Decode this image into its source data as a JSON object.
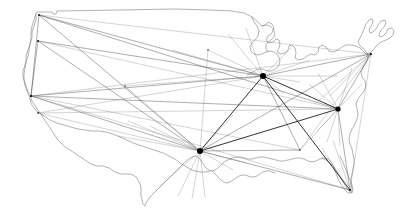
{
  "figure": {
    "type": "network-map",
    "region": "Continental United States",
    "background_color": "#ffffff",
    "outline_color": "#808080",
    "route_color": "#2b2b2b",
    "node_color": "#000000",
    "width": 409,
    "height": 212
  },
  "nodes": [
    {
      "id": "sea",
      "label": "Seattle",
      "x": 39,
      "y": 15,
      "kind": "minor",
      "radius": 0.9
    },
    {
      "id": "pdx",
      "label": "Portland",
      "x": 38,
      "y": 41,
      "kind": "minor",
      "radius": 0.9
    },
    {
      "id": "sfo",
      "label": "San Francisco",
      "x": 31,
      "y": 96,
      "kind": "minor",
      "radius": 1.1
    },
    {
      "id": "lax",
      "label": "Los Angeles",
      "x": 38,
      "y": 113,
      "kind": "minor",
      "radius": 0.8
    },
    {
      "id": "den",
      "label": "Denver",
      "x": 125,
      "y": 86,
      "kind": "minor",
      "radius": 0.7
    },
    {
      "id": "dfw",
      "label": "Dallas Fort Worth",
      "x": 200,
      "y": 151,
      "kind": "hub",
      "radius": 3.0
    },
    {
      "id": "ord",
      "label": "Chicago OHare",
      "x": 263,
      "y": 76,
      "kind": "hub",
      "radius": 3.0
    },
    {
      "id": "iad",
      "label": "Washington Dulles",
      "x": 338,
      "y": 109,
      "kind": "hub",
      "radius": 2.6
    },
    {
      "id": "bos",
      "label": "Boston",
      "x": 371,
      "y": 54,
      "kind": "minor",
      "radius": 1.0
    },
    {
      "id": "mia",
      "label": "Miami",
      "x": 350,
      "y": 190,
      "kind": "minor",
      "radius": 1.0
    },
    {
      "id": "atl",
      "label": "Atlanta",
      "x": 300,
      "y": 150,
      "kind": "minor",
      "radius": 0.7
    },
    {
      "id": "msp",
      "label": "Minneapolis",
      "x": 208,
      "y": 50,
      "kind": "minor",
      "radius": 0.7
    }
  ],
  "routes": [
    {
      "from": "sea",
      "to": "ord",
      "weight": "normal"
    },
    {
      "from": "sea",
      "to": "dfw",
      "weight": "normal"
    },
    {
      "from": "sea",
      "to": "iad",
      "weight": "normal"
    },
    {
      "from": "sea",
      "to": "sfo",
      "weight": "normal"
    },
    {
      "from": "sea",
      "to": "bos",
      "weight": "faint"
    },
    {
      "from": "pdx",
      "to": "ord",
      "weight": "normal"
    },
    {
      "from": "pdx",
      "to": "dfw",
      "weight": "normal"
    },
    {
      "from": "pdx",
      "to": "iad",
      "weight": "faint"
    },
    {
      "from": "pdx",
      "to": "sfo",
      "weight": "normal"
    },
    {
      "from": "sfo",
      "to": "ord",
      "weight": "normal"
    },
    {
      "from": "sfo",
      "to": "dfw",
      "weight": "normal"
    },
    {
      "from": "sfo",
      "to": "iad",
      "weight": "normal"
    },
    {
      "from": "sfo",
      "to": "bos",
      "weight": "faint"
    },
    {
      "from": "sfo",
      "to": "mia",
      "weight": "faint"
    },
    {
      "from": "sfo",
      "to": "atl",
      "weight": "faint"
    },
    {
      "from": "lax",
      "to": "ord",
      "weight": "faint"
    },
    {
      "from": "lax",
      "to": "dfw",
      "weight": "faint"
    },
    {
      "from": "lax",
      "to": "iad",
      "weight": "faint"
    },
    {
      "from": "den",
      "to": "ord",
      "weight": "faint"
    },
    {
      "from": "den",
      "to": "dfw",
      "weight": "faint"
    },
    {
      "from": "dfw",
      "to": "ord",
      "weight": "heavy"
    },
    {
      "from": "dfw",
      "to": "iad",
      "weight": "heavy"
    },
    {
      "from": "dfw",
      "to": "bos",
      "weight": "normal"
    },
    {
      "from": "dfw",
      "to": "mia",
      "weight": "normal"
    },
    {
      "from": "dfw",
      "to": "atl",
      "weight": "normal"
    },
    {
      "from": "dfw",
      "to": "msp",
      "weight": "faint"
    },
    {
      "from": "ord",
      "to": "iad",
      "weight": "heavy"
    },
    {
      "from": "ord",
      "to": "bos",
      "weight": "normal"
    },
    {
      "from": "ord",
      "to": "mia",
      "weight": "heavy"
    },
    {
      "from": "ord",
      "to": "atl",
      "weight": "normal"
    },
    {
      "from": "ord",
      "to": "msp",
      "weight": "faint"
    },
    {
      "from": "iad",
      "to": "bos",
      "weight": "normal"
    },
    {
      "from": "iad",
      "to": "mia",
      "weight": "normal"
    },
    {
      "from": "iad",
      "to": "atl",
      "weight": "faint"
    },
    {
      "from": "bos",
      "to": "mia",
      "weight": "faint"
    },
    {
      "from": "bos",
      "to": "atl",
      "weight": "faint"
    }
  ],
  "spokes": [
    {
      "hub": "dfw",
      "x": 128,
      "y": 121,
      "weight": "faint"
    },
    {
      "hub": "dfw",
      "x": 150,
      "y": 126,
      "weight": "faint"
    },
    {
      "hub": "dfw",
      "x": 160,
      "y": 186,
      "weight": "faint"
    },
    {
      "hub": "dfw",
      "x": 178,
      "y": 196,
      "weight": "faint"
    },
    {
      "hub": "dfw",
      "x": 192,
      "y": 199,
      "weight": "faint"
    },
    {
      "hub": "dfw",
      "x": 205,
      "y": 197,
      "weight": "faint"
    },
    {
      "hub": "dfw",
      "x": 233,
      "y": 170,
      "weight": "faint"
    },
    {
      "hub": "dfw",
      "x": 246,
      "y": 163,
      "weight": "faint"
    },
    {
      "hub": "dfw",
      "x": 233,
      "y": 115,
      "weight": "faint"
    },
    {
      "hub": "dfw",
      "x": 118,
      "y": 136,
      "weight": "faint"
    },
    {
      "hub": "ord",
      "x": 172,
      "y": 50,
      "weight": "faint"
    },
    {
      "hub": "ord",
      "x": 228,
      "y": 34,
      "weight": "faint"
    },
    {
      "hub": "ord",
      "x": 246,
      "y": 28,
      "weight": "faint"
    },
    {
      "hub": "ord",
      "x": 291,
      "y": 48,
      "weight": "faint"
    },
    {
      "hub": "ord",
      "x": 310,
      "y": 60,
      "weight": "faint"
    },
    {
      "hub": "ord",
      "x": 300,
      "y": 82,
      "weight": "faint"
    },
    {
      "hub": "ord",
      "x": 284,
      "y": 94,
      "weight": "faint"
    },
    {
      "hub": "ord",
      "x": 338,
      "y": 76,
      "weight": "faint"
    },
    {
      "hub": "iad",
      "x": 309,
      "y": 84,
      "weight": "faint"
    },
    {
      "hub": "iad",
      "x": 318,
      "y": 73,
      "weight": "faint"
    },
    {
      "hub": "iad",
      "x": 352,
      "y": 68,
      "weight": "faint"
    },
    {
      "hub": "iad",
      "x": 362,
      "y": 84,
      "weight": "faint"
    },
    {
      "hub": "iad",
      "x": 317,
      "y": 131,
      "weight": "faint"
    },
    {
      "hub": "iad",
      "x": 327,
      "y": 142,
      "weight": "faint"
    },
    {
      "hub": "iad",
      "x": 340,
      "y": 146,
      "weight": "faint"
    },
    {
      "hub": "bos",
      "x": 330,
      "y": 96,
      "weight": "faint"
    },
    {
      "hub": "bos",
      "x": 315,
      "y": 104,
      "weight": "faint"
    },
    {
      "hub": "mia",
      "x": 322,
      "y": 148,
      "weight": "faint"
    },
    {
      "hub": "mia",
      "x": 333,
      "y": 140,
      "weight": "faint"
    }
  ],
  "outline": {
    "name": "continental-us-border",
    "path": "M 39 14 L 55 13 L 78 12 L 110 11 L 150 10 L 185 10 L 212 10 L 238 11 L 258 13 L 266 17 L 264 24 L 260 30 L 256 36 L 259 41 L 266 43 L 272 41 L 278 39 L 283 41 L 287 45 L 292 44 L 296 40 L 300 36 L 305 34 L 311 36 L 316 40 L 320 45 L 324 49 L 330 50 L 337 48 L 344 46 L 352 46 L 360 48 L 366 51 L 371 54 L 376 51 L 381 47 L 386 43 L 390 38 L 393 32 L 395 26 L 393 21 L 389 19 L 385 22 L 382 27 L 379 32 L 376 35 L 373 32 L 374 27 L 377 22 L 380 17 L 381 12 L 378 9 L 373 11 L 369 16 L 366 22 L 362 28 L 357 32 L 352 34 L 347 33 L 344 29 L 343 24 L 345 19 L 348 15 L 350 10 L 347 7 L 342 9 L 338 14 L 335 20 L 332 26 L 329 31 L 325 33 L 320 32 L 316 28 L 313 23 L 311 18 L 309 13 L 306 10 L 302 12 L 300 17 L 299 23 L 298 29 L 296 34 L 292 35 L 288 32 L 285 28 L 283 23 L 282 18 L 280 14 L 277 12 L 273 14 L 271 19 L 270 25 L 269 31 L 267 36 L 263 38 L 259 36 L 256 32 L 254 27 L 253 22 L 252 17 L 250 14 L 247 15 L 245 19 L 244 24 L 243 29 L 242 34 L 240 38 L 237 39 L 233 37 L 230 33 L 228 28 L 227 23",
    "simplified": true
  },
  "legend": {
    "visible": false
  }
}
